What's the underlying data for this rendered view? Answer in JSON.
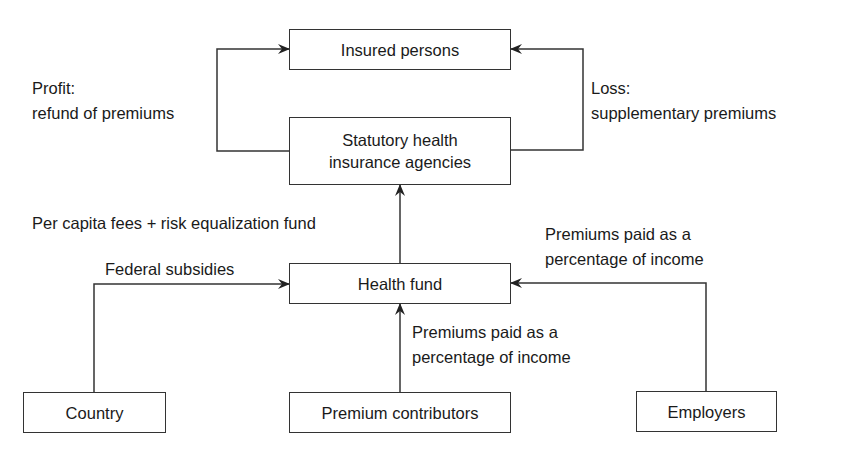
{
  "diagram": {
    "nodes": {
      "insured_persons": "Insured persons",
      "statutory_agencies_line1": "Statutory health",
      "statutory_agencies_line2": "insurance agencies",
      "health_fund": "Health fund",
      "country": "Country",
      "premium_contributors": "Premium contributors",
      "employers": "Employers"
    },
    "edges": {
      "profit_line1": "Profit:",
      "profit_line2": "refund of premiums",
      "loss_line1": "Loss:",
      "loss_line2": "supplementary premiums",
      "per_capita": "Per capita fees + risk equalization fund",
      "federal_subsidies": "Federal subsidies",
      "employer_premiums_line1": "Premiums paid as a",
      "employer_premiums_line2": "percentage of income",
      "contributor_premiums_line1": "Premiums paid as a",
      "contributor_premiums_line2": "percentage of income"
    },
    "line_color": "#333333"
  }
}
